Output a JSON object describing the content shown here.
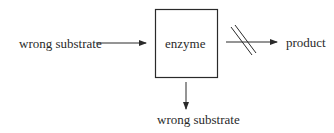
{
  "diagram": {
    "enzyme_label": "enzyme",
    "input_label": "wrong substrate",
    "output_label": "product",
    "rejected_label": "wrong substrate",
    "blocked_marker": "double-slash-blocked",
    "colors": {
      "stroke": "#2a2a2a",
      "background": "#ffffff"
    }
  }
}
